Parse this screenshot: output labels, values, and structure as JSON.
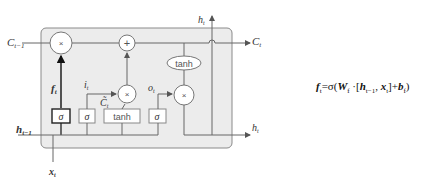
{
  "diagram": {
    "labels": {
      "c_prev": "C",
      "c_prev_sub": "t−1",
      "c_next": "C",
      "c_next_sub": "t",
      "h_prev": "h",
      "h_prev_sub": "t−1",
      "h_out_top": "h",
      "h_out_top_sub": "t",
      "h_out_right": "h",
      "h_out_right_sub": "t",
      "x_in": "x",
      "x_in_sub": "t",
      "f_gate": "f",
      "f_gate_sub": "t",
      "i_gate": "i",
      "i_gate_sub": "t",
      "c_tilde": "C̃",
      "c_tilde_sub": "t",
      "o_gate": "o",
      "o_gate_sub": "t"
    },
    "ops": {
      "multiply": "×",
      "add": "+",
      "sigma": "σ",
      "tanh": "tanh"
    },
    "colors": {
      "cell_fill": "#ececec",
      "cell_border": "#8a8a8a",
      "line": "#555555",
      "highlight": "#222222"
    }
  },
  "formula": {
    "lhs": "f",
    "lhs_sub": "t",
    "eq": "=σ(",
    "w": "W",
    "w_sub": "f",
    "dot": " ·[",
    "h": "h",
    "h_sub": "t−1",
    "comma": ", ",
    "x": "x",
    "x_sub": "t",
    "close": "]+",
    "b": "b",
    "b_sub": "f",
    "end": ")"
  }
}
